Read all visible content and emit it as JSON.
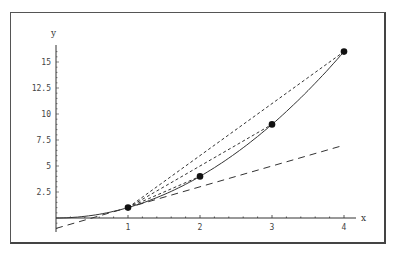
{
  "chart_data": {
    "type": "line",
    "title": "",
    "xlabel": "x",
    "ylabel": "y",
    "xlim": [
      0,
      4
    ],
    "ylim": [
      -1.3,
      16.5
    ],
    "x_ticks": [
      "1",
      "2",
      "3",
      "4"
    ],
    "y_ticks": [
      "2.5",
      "5",
      "7.5",
      "10",
      "12.5",
      "15"
    ],
    "grid": false,
    "legend": null,
    "series": [
      {
        "name": "curve y = x^2",
        "style": "solid",
        "x": [
          0,
          0.5,
          1,
          1.5,
          2,
          2.5,
          3,
          3.5,
          4
        ],
        "y": [
          0,
          0.25,
          1,
          2.25,
          4,
          6.25,
          9,
          12.25,
          16
        ]
      },
      {
        "name": "tangent at x=1 (y = 2x - 1)",
        "style": "long-dashed",
        "x": [
          0,
          4
        ],
        "y": [
          -1,
          7
        ]
      },
      {
        "name": "secant (1,1)-(2,4)",
        "style": "dashed",
        "x": [
          1,
          2
        ],
        "y": [
          1,
          4
        ]
      },
      {
        "name": "secant (1,1)-(3,9)",
        "style": "dashed",
        "x": [
          1,
          3
        ],
        "y": [
          1,
          9
        ]
      },
      {
        "name": "secant (1,1)-(4,16)",
        "style": "dashed",
        "x": [
          1,
          4
        ],
        "y": [
          1,
          16
        ]
      }
    ],
    "points": [
      {
        "x": 1,
        "y": 1
      },
      {
        "x": 2,
        "y": 4
      },
      {
        "x": 3,
        "y": 9
      },
      {
        "x": 4,
        "y": 16
      }
    ]
  },
  "axes": {
    "x_label": "x",
    "y_label": "y",
    "x_tick_labels": [
      "1",
      "2",
      "3",
      "4"
    ],
    "y_tick_labels": [
      "2.5",
      "5",
      "7.5",
      "10",
      "12.5",
      "15"
    ]
  }
}
